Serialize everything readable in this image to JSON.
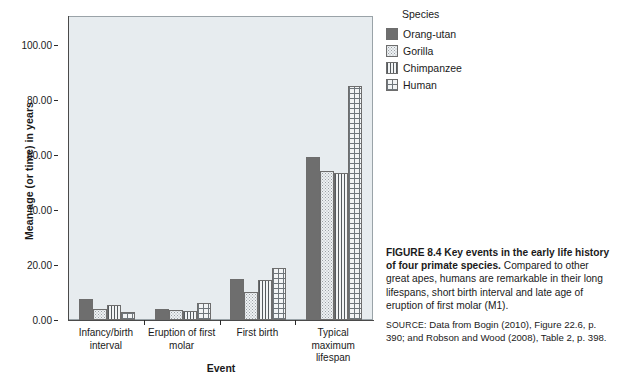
{
  "chart_data": {
    "type": "bar",
    "title": "",
    "xlabel": "Event",
    "ylabel": "Mean age (or time) in years",
    "categories": [
      "Infancy/birth interval",
      "Eruption of first molar",
      "First birth",
      "Typical maximum lifespan"
    ],
    "series": [
      {
        "name": "Orang-utan",
        "values": [
          7.7,
          3.9,
          15.0,
          59.0
        ]
      },
      {
        "name": "Gorilla",
        "values": [
          4.0,
          3.8,
          10.0,
          54.0
        ]
      },
      {
        "name": "Chimpanzee",
        "values": [
          5.5,
          3.1,
          14.5,
          53.5
        ]
      },
      {
        "name": "Human",
        "values": [
          3.0,
          6.0,
          19.0,
          85.0
        ]
      }
    ],
    "ylim": [
      0,
      110
    ],
    "yticks": [
      0,
      20,
      40,
      60,
      80,
      100
    ],
    "ytick_labels": [
      "0.00",
      "20.00",
      "40.00",
      "60.00",
      "80.00",
      "100.00"
    ],
    "grid": false,
    "legend_position": "right",
    "legend_title": "Species",
    "colors": {
      "orangutan": "#6e6e6e",
      "gorilla": "#eef1f3",
      "chimpanzee": "#555a5e",
      "human": "#6f767b",
      "plot_background": "#e7ecef",
      "axis": "#4a4a4a"
    },
    "patterns": [
      "solid",
      "dots",
      "vertical-lines",
      "crosshatch"
    ]
  },
  "legend": {
    "title": "Species",
    "items": [
      {
        "label": "Orang-utan",
        "pattern": "solid"
      },
      {
        "label": "Gorilla",
        "pattern": "dots"
      },
      {
        "label": "Chimpanzee",
        "pattern": "vertical-lines"
      },
      {
        "label": "Human",
        "pattern": "crosshatch"
      }
    ]
  },
  "caption": {
    "figure_number": "FIGURE 8.4",
    "headline": "Key events in the early life history of four primate species.",
    "body": "Compared to other great apes, humans are remarkable in their long lifespans, short birth interval and late age of eruption of first molar (M1).",
    "source_label": "SOURCE:",
    "source_text": "Data from Bogin (2010), Figure 22.6, p. 390; and Robson and Wood (2008), Table 2, p. 398."
  }
}
